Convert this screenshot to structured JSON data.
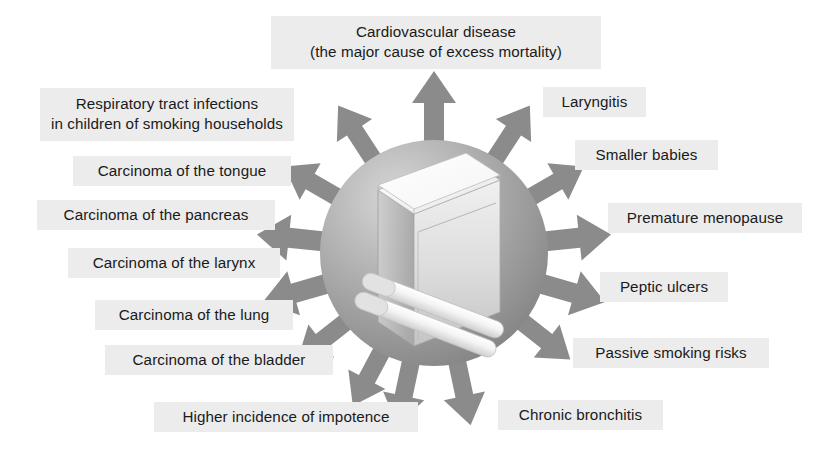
{
  "diagram": {
    "center": {
      "shape": "sphere",
      "contents": "cigarette packet with two cigarettes",
      "sphere_color": "#9a9a9a",
      "packet_color": "#e8e8e8",
      "cigarette_color": "#f2f2f2"
    },
    "arrow_color": "#8b8b8b",
    "label_background": "#ececec",
    "label_text_color": "#1a1a1a",
    "labels": [
      {
        "id": "cardiovascular-disease",
        "text": "Cardiovascular disease\n(the major cause of excess mortality)",
        "lines": 2,
        "x": 271,
        "y": 16,
        "width": 330,
        "side": "top"
      },
      {
        "id": "respiratory-tract-infections",
        "text": "Respiratory tract infections\nin children of smoking households",
        "lines": 2,
        "x": 40,
        "y": 88,
        "width": 254,
        "side": "left"
      },
      {
        "id": "laryngitis",
        "text": "Laryngitis",
        "lines": 1,
        "x": 543,
        "y": 87,
        "width": 103,
        "side": "right"
      },
      {
        "id": "carcinoma-of-the-tongue",
        "text": "Carcinoma of the tongue",
        "lines": 1,
        "x": 73,
        "y": 156,
        "width": 218,
        "side": "left"
      },
      {
        "id": "smaller-babies",
        "text": "Smaller babies",
        "lines": 1,
        "x": 575,
        "y": 140,
        "width": 143,
        "side": "right"
      },
      {
        "id": "carcinoma-of-the-pancreas",
        "text": "Carcinoma of the pancreas",
        "lines": 1,
        "x": 37,
        "y": 200,
        "width": 238,
        "side": "left"
      },
      {
        "id": "premature-menopause",
        "text": "Premature menopause",
        "lines": 1,
        "x": 608,
        "y": 203,
        "width": 194,
        "side": "right"
      },
      {
        "id": "carcinoma-of-the-larynx",
        "text": "Carcinoma of the larynx",
        "lines": 1,
        "x": 68,
        "y": 248,
        "width": 212,
        "side": "left"
      },
      {
        "id": "peptic-ulcers",
        "text": "Peptic ulcers",
        "lines": 1,
        "x": 600,
        "y": 272,
        "width": 128,
        "side": "right"
      },
      {
        "id": "carcinoma-of-the-lung",
        "text": "Carcinoma of the lung",
        "lines": 1,
        "x": 95,
        "y": 300,
        "width": 198,
        "side": "left"
      },
      {
        "id": "passive-smoking-risks",
        "text": "Passive smoking risks",
        "lines": 1,
        "x": 573,
        "y": 338,
        "width": 196,
        "side": "right"
      },
      {
        "id": "carcinoma-of-the-bladder",
        "text": "Carcinoma of the bladder",
        "lines": 1,
        "x": 105,
        "y": 345,
        "width": 228,
        "side": "left"
      },
      {
        "id": "higher-incidence-of-impotence",
        "text": "Higher incidence of impotence",
        "lines": 1,
        "x": 154,
        "y": 402,
        "width": 264,
        "side": "bottom-left"
      },
      {
        "id": "chronic-bronchitis",
        "text": "Chronic bronchitis",
        "lines": 1,
        "x": 498,
        "y": 400,
        "width": 165,
        "side": "bottom-right"
      }
    ]
  }
}
